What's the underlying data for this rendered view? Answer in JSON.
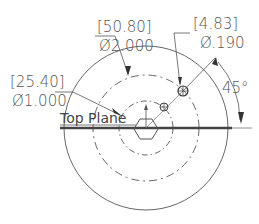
{
  "drawing": {
    "plane_label": "Top Plane",
    "dimensions": [
      {
        "id": "outer-bolt-circle",
        "metric": "[50.80]",
        "imperial": "Ø2.000"
      },
      {
        "id": "inner-bolt-circle",
        "metric": "[25.40]",
        "imperial": "Ø1.000"
      },
      {
        "id": "hole-diameter",
        "metric": "[4.83]",
        "imperial": "Ø.190"
      }
    ],
    "angle": "45°",
    "colors": {
      "line": "#555555",
      "thick_line": "#444444",
      "background": "#ffffff"
    }
  }
}
